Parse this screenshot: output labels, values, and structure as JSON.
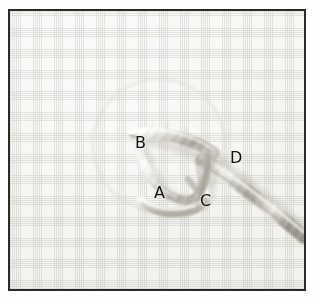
{
  "figure": {
    "kind": "photograph",
    "frame_color": "#2a2a2a",
    "page_background": "#ffffff",
    "fabric_color": "#fafaf8",
    "cord_color": "#b9b6ad",
    "label_color": "#111111"
  },
  "labels": [
    {
      "id": "A",
      "text": "A",
      "x": 152,
      "y": 182
    },
    {
      "id": "B",
      "text": "B",
      "x": 133,
      "y": 132
    },
    {
      "id": "C",
      "text": "C",
      "x": 198,
      "y": 190
    },
    {
      "id": "D",
      "text": "D",
      "x": 228,
      "y": 147
    }
  ],
  "guide_circle": {
    "name": "faint-traced-circle",
    "center_x": 157,
    "center_y": 143,
    "radius": 66,
    "stroke": "#d9d6d0",
    "style": "dotted"
  },
  "cord": {
    "name": "twisted-cord",
    "entry_point": "bottom-right",
    "forms": "loop with crossing tail",
    "highlight": "#ffffff",
    "shadow": "#9e9b92"
  }
}
